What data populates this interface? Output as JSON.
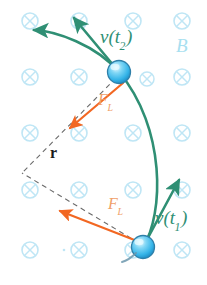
{
  "figure": {
    "background_color": "#ffffff"
  },
  "colors": {
    "velocity": "#2f8f74",
    "force": "#f26722",
    "force_label": "#f0a068",
    "field_marker": "#bfe6f5",
    "field_label": "#a8dff0",
    "radius_line": "#6b6b6b",
    "particle_fill": "#49c0ef",
    "particle_stroke": "#3a7ea8",
    "particle_highlight": "#d9f3fd"
  },
  "labels": {
    "velocity_t2": {
      "text": "v(t",
      "sub": "2",
      "close": ")",
      "name": "velocity at time t2"
    },
    "velocity_t1": {
      "text": "v(t",
      "sub": "1",
      "close": ")",
      "name": "velocity at time t1"
    },
    "magnetic_field": {
      "text": "B",
      "name": "magnetic field"
    },
    "lorentz_force_top": {
      "text": "F",
      "sub": "L",
      "name": "Lorentz force at t2"
    },
    "lorentz_force_bottom": {
      "text": "F",
      "sub": "L",
      "name": "Lorentz force at t1"
    },
    "radius": {
      "text": "r",
      "name": "orbit radius"
    }
  },
  "field_markers": {
    "symbol": "circle-x",
    "meaning": "magnetic field directed into the page",
    "columns_x": [
      30,
      79,
      133,
      182
    ],
    "rows_y": [
      21,
      77,
      133,
      190,
      250
    ],
    "radius": 8,
    "positions": [
      [
        30,
        21
      ],
      [
        79,
        21
      ],
      [
        133,
        21
      ],
      [
        182,
        21
      ],
      [
        30,
        77
      ],
      [
        79,
        77
      ],
      [
        133,
        77
      ],
      [
        182,
        77
      ],
      [
        30,
        133
      ],
      [
        79,
        133
      ],
      [
        133,
        133
      ],
      [
        182,
        133
      ],
      [
        30,
        190
      ],
      [
        79,
        190
      ],
      [
        133,
        190
      ],
      [
        182,
        190
      ],
      [
        30,
        250
      ],
      [
        79,
        250
      ],
      [
        133,
        250
      ],
      [
        182,
        250
      ]
    ]
  },
  "particles": [
    {
      "id": "particle-t2",
      "cx": 119,
      "cy": 72,
      "r": 11.5,
      "label": "charged particle at time t2"
    },
    {
      "id": "particle-t1",
      "cx": 143,
      "cy": 247,
      "r": 11.5,
      "label": "charged particle at time t1"
    }
  ],
  "trajectory": {
    "name": "circular-arc-path",
    "path": "M 143 247 C 163 212 165 130 119 72",
    "tail": "M 119 72 C 95 46 55 32 20 29"
  },
  "vectors": [
    {
      "id": "velocity-t2-arrow",
      "type": "velocity",
      "x1": 119,
      "y1": 72,
      "x2": 72,
      "y2": 16,
      "label": "v(t2)"
    },
    {
      "id": "velocity-t1-arrow",
      "type": "velocity",
      "x1": 143,
      "y1": 247,
      "x2": 180,
      "y2": 177,
      "label": "v(t1)"
    },
    {
      "id": "trajectory-tail-arrow",
      "type": "velocity",
      "x1": 40,
      "y1": 30,
      "x2": 12,
      "y2": 30,
      "label": "path continuation"
    },
    {
      "id": "lorentz-force-top-arrow",
      "type": "force",
      "x1": 122,
      "y1": 82,
      "x2": 66,
      "y2": 131,
      "label": "F_L at t2"
    },
    {
      "id": "lorentz-force-bottom-arrow",
      "type": "force",
      "x1": 136,
      "y1": 241,
      "x2": 55,
      "y2": 210,
      "label": "F_L at t1"
    }
  ],
  "radius_lines": [
    {
      "id": "radius-line-top",
      "x1": 119,
      "y1": 72,
      "x2": 22,
      "y2": 173,
      "dashed": true
    },
    {
      "id": "radius-line-bottom",
      "x1": 143,
      "y1": 247,
      "x2": 22,
      "y2": 173,
      "dashed": true
    }
  ]
}
